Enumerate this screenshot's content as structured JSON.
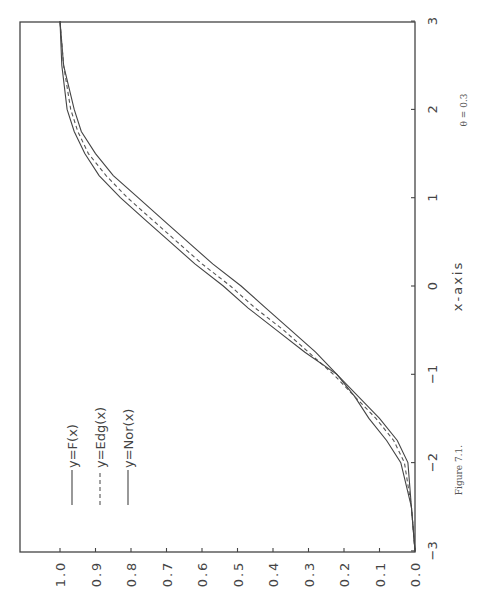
{
  "chart_data": {
    "type": "line",
    "orientation": "rotated-90-counterclockwise",
    "title": "",
    "caption": "Figure 7.1.",
    "annotation": "θ = 0.3",
    "xlabel": "x-axis",
    "ylabel": "",
    "xlim": [
      -3,
      3
    ],
    "ylim": [
      0,
      1
    ],
    "xticks": [
      "-3",
      "-2",
      "-1",
      "0",
      "1",
      "2",
      "3"
    ],
    "yticks": [
      "0.0",
      "0.1",
      "0.2",
      "0.3",
      "0.4",
      "0.5",
      "0.6",
      "0.7",
      "0.8",
      "0.9",
      "1.0"
    ],
    "grid": false,
    "legend_position": "upper-left (inside plot)",
    "x": [
      -3.0,
      -2.5,
      -2.0,
      -1.75,
      -1.5,
      -1.25,
      -1.0,
      -0.75,
      -0.5,
      -0.25,
      0.0,
      0.25,
      0.5,
      0.75,
      1.0,
      1.25,
      1.5,
      1.75,
      2.0,
      2.5,
      3.0
    ],
    "series": [
      {
        "name": "y=F(x)",
        "style": "solid",
        "values": [
          0.0,
          0.01,
          0.04,
          0.08,
          0.13,
          0.17,
          0.22,
          0.28,
          0.35,
          0.42,
          0.49,
          0.57,
          0.64,
          0.71,
          0.78,
          0.85,
          0.9,
          0.94,
          0.96,
          0.99,
          1.0
        ]
      },
      {
        "name": "y=Edg(x)",
        "style": "dashed",
        "values": [
          0.0,
          0.01,
          0.03,
          0.06,
          0.11,
          0.17,
          0.23,
          0.3,
          0.37,
          0.45,
          0.52,
          0.6,
          0.67,
          0.74,
          0.81,
          0.87,
          0.92,
          0.95,
          0.97,
          0.99,
          1.0
        ]
      },
      {
        "name": "y=Nor(x)",
        "style": "solid",
        "values": [
          0.0,
          0.01,
          0.02,
          0.05,
          0.1,
          0.16,
          0.22,
          0.31,
          0.39,
          0.47,
          0.54,
          0.62,
          0.69,
          0.76,
          0.83,
          0.89,
          0.93,
          0.96,
          0.98,
          0.995,
          1.0
        ]
      }
    ]
  },
  "legend": {
    "items": [
      {
        "label": "y=F(x)"
      },
      {
        "label": "y=Edg(x)"
      },
      {
        "label": "y=Nor(x)"
      }
    ]
  },
  "labels": {
    "xaxis": "x-axis",
    "caption": "Figure 7.1.",
    "theta": "θ = 0.3"
  }
}
